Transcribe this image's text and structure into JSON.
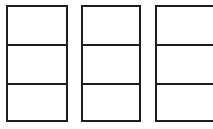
{
  "diagram": {
    "line_color": "#1e1e1e",
    "background": "#ffffff",
    "boxes": [
      {
        "id": "box-1",
        "left": 6,
        "top": 5,
        "width": 62,
        "height": 117,
        "rows": 3,
        "clipped": false
      },
      {
        "id": "box-2",
        "left": 81,
        "top": 5,
        "width": 60,
        "height": 117,
        "rows": 3,
        "clipped": false
      },
      {
        "id": "box-3",
        "left": 155,
        "top": 5,
        "width": 60,
        "height": 117,
        "rows": 3,
        "clipped": true
      }
    ],
    "row_dividers_y": [
      44,
      83
    ]
  }
}
